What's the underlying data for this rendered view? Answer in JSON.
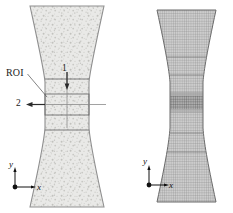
{
  "figure": {
    "width": 233,
    "height": 213,
    "background_color": "#ffffff"
  },
  "panels": [
    {
      "id": "speckle-specimen",
      "name": "Speckled dogbone tensile specimen with region of interest",
      "outline_color": "#8c8c8c",
      "fill_color": "#e8e8e6",
      "speckle_color": "#c9c9c6",
      "band_line_color": "#6e6e6e"
    },
    {
      "id": "mesh-specimen",
      "name": "Finite element mesh of dogbone tensile specimen",
      "outline_color": "#6b6b6b",
      "mesh_color": "#8a8a8a",
      "mesh_dark_band_color": "#4a4a4a"
    }
  ],
  "annotations": {
    "roi_label": "ROI",
    "direction_1_label": "1",
    "direction_2_label": "2"
  },
  "axes": {
    "left": {
      "x_label": "x",
      "y_label": "y"
    },
    "right": {
      "x_label": "x",
      "y_label": "y"
    }
  }
}
